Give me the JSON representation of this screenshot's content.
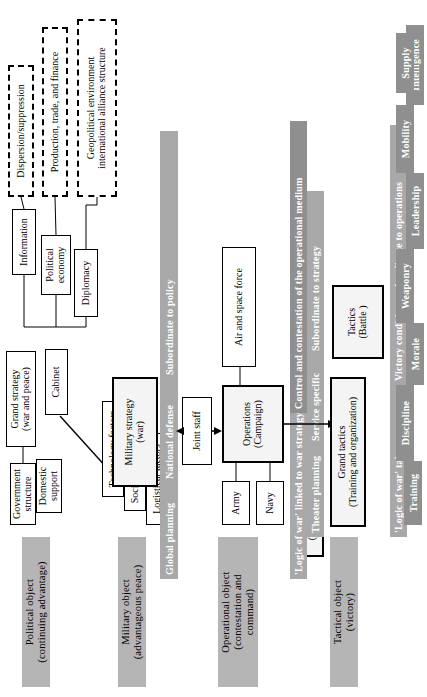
{
  "figure": {
    "orientation": "rotated-90-ccw",
    "accent_gray": "#a8a8a8",
    "object_bar_gray": "#b5b5b5",
    "dark_gray": "#8f8f8f"
  },
  "objects": {
    "political": "Political object\n(continuing advantage)",
    "political_line1": "Political object",
    "political_line2": "(continuing advantage)",
    "military_line1": "Military object",
    "military_line2": "(advantageous peace)",
    "operational_line1": "Operational object",
    "operational_line2": "(contestation and",
    "operational_line3": "command)",
    "tactical_line1": "Tactical object",
    "tactical_line2": "(victory)"
  },
  "level_bars": {
    "subordinate_to_policy": "Subordinate to policy",
    "national_defense": "National defense",
    "global_planning": "Global planning",
    "control_contestation": "Control and contestation of the operational medium",
    "logic_of_war_linked": "'Logic of war' linked to war strategy",
    "subordinate_to_strategy": "Subordinate to strategy",
    "service_specific": "Service specific",
    "theater_planning": "Theater planning",
    "victory_conditions": "Victory conditions subordinate to operations",
    "logic_of_war_takes_over": "'Logic of war' takes over"
  },
  "political_level": {
    "grand_strategy_l1": "Grand strategy",
    "grand_strategy_l2": "(war and peace)",
    "cabinet": "Cabinet",
    "government_structure_l1": "Government",
    "government_structure_l2": "structure",
    "domestic_support_l1": "Domestic",
    "domestic_support_l2": "support",
    "information": "Information",
    "political_economy_l1": "Political",
    "political_economy_l2": "economy",
    "diplomacy": "Diplomacy",
    "dispersion_suppression": "Dispersion/suppression",
    "production_trade_finance": "Production, trade, and finance",
    "geopolitical_environment": "Geopolitical environment",
    "international_alliance_structure": "international alliance structure"
  },
  "military_level": {
    "military_strategy_l1": "Military strategy",
    "military_strategy_l2": "(war)",
    "technology_factors": "Technology factors",
    "socio_political_factors": "Socio-political factors",
    "logistical_factors": "Logistical factors",
    "joint_staff": "Joint staff"
  },
  "operational_level": {
    "operational_strategy_l1": "Operational strategy",
    "operational_strategy_l2": "(Logistics and acquisition)",
    "operations_l1": "Operations",
    "operations_l2": "(Campaign)",
    "army": "Army",
    "navy": "Navy",
    "air_and_space_force": "Air and space force"
  },
  "tactical_level": {
    "grand_tactics_l1": "Grand tactics",
    "grand_tactics_l2": "(Training and organization)",
    "tactics_l1": "Tactics",
    "tactics_l2": "(Battle )",
    "training": "Training",
    "discipline": "Discipline",
    "morale": "Morale",
    "weaponry": "Weaponry",
    "leadership": "Leadership",
    "mobility": "Mobility",
    "intelligence": "Intelligence",
    "supply": "Supply"
  }
}
